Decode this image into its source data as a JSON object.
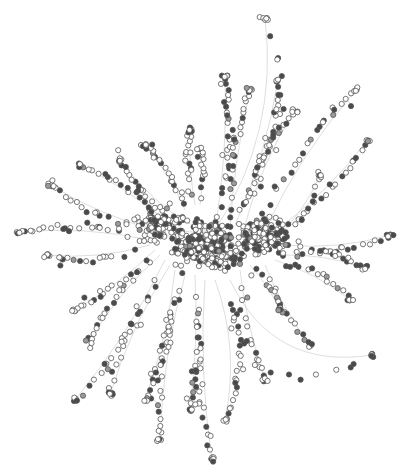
{
  "diagram": {
    "type": "network-graph",
    "layout": "force-directed",
    "width": 410,
    "height": 475,
    "colors": {
      "background": "#ffffff",
      "edge": "#c8c8c8",
      "node_stroke": "#555555",
      "node_fill_light": "#ffffff",
      "node_fill_dark": "#4a4a4a",
      "node_fill_mid": "#9a9a9a"
    },
    "node_radius": 2.6,
    "dark_ratio": 0.33,
    "seed": 17,
    "hubs": [
      {
        "x": 205,
        "y": 245,
        "count": 320,
        "spread": 32
      },
      {
        "x": 262,
        "y": 235,
        "count": 170,
        "spread": 26
      },
      {
        "x": 160,
        "y": 225,
        "count": 90,
        "spread": 24
      }
    ],
    "branches": [
      {
        "from": [
          215,
          230
        ],
        "to": [
          265,
          18
        ],
        "n": 10,
        "bend": 40
      },
      {
        "from": [
          215,
          230
        ],
        "to": [
          225,
          75
        ],
        "n": 22,
        "bend": 8
      },
      {
        "from": [
          230,
          230
        ],
        "to": [
          250,
          90
        ],
        "n": 22,
        "bend": -6
      },
      {
        "from": [
          235,
          225
        ],
        "to": [
          278,
          80
        ],
        "n": 18,
        "bend": 10
      },
      {
        "from": [
          245,
          225
        ],
        "to": [
          295,
          110
        ],
        "n": 20,
        "bend": -10
      },
      {
        "from": [
          265,
          230
        ],
        "to": [
          356,
          90
        ],
        "n": 18,
        "bend": -12
      },
      {
        "from": [
          270,
          235
        ],
        "to": [
          368,
          140
        ],
        "n": 16,
        "bend": 10
      },
      {
        "from": [
          275,
          240
        ],
        "to": [
          320,
          175
        ],
        "n": 10,
        "bend": 8
      },
      {
        "from": [
          285,
          245
        ],
        "to": [
          390,
          235
        ],
        "n": 14,
        "bend": 10
      },
      {
        "from": [
          280,
          255
        ],
        "to": [
          365,
          268
        ],
        "n": 14,
        "bend": -8
      },
      {
        "from": [
          275,
          260
        ],
        "to": [
          350,
          300
        ],
        "n": 12,
        "bend": -8
      },
      {
        "from": [
          265,
          265
        ],
        "to": [
          310,
          345
        ],
        "n": 12,
        "bend": 6
      },
      {
        "from": [
          250,
          265
        ],
        "to": [
          280,
          310
        ],
        "n": 10,
        "bend": -4
      },
      {
        "from": [
          240,
          270
        ],
        "to": [
          265,
          380
        ],
        "n": 12,
        "bend": 6
      },
      {
        "from": [
          230,
          280
        ],
        "to": [
          372,
          355
        ],
        "n": 10,
        "bend": 60
      },
      {
        "from": [
          215,
          280
        ],
        "to": [
          225,
          420
        ],
        "n": 16,
        "bend": -20
      },
      {
        "from": [
          205,
          280
        ],
        "to": [
          212,
          460
        ],
        "n": 16,
        "bend": 10
      },
      {
        "from": [
          195,
          275
        ],
        "to": [
          190,
          410
        ],
        "n": 16,
        "bend": -6
      },
      {
        "from": [
          185,
          275
        ],
        "to": [
          160,
          440
        ],
        "n": 18,
        "bend": 10
      },
      {
        "from": [
          175,
          270
        ],
        "to": [
          145,
          400
        ],
        "n": 18,
        "bend": -8
      },
      {
        "from": [
          170,
          265
        ],
        "to": [
          110,
          395
        ],
        "n": 14,
        "bend": 10
      },
      {
        "from": [
          165,
          260
        ],
        "to": [
          75,
          400
        ],
        "n": 14,
        "bend": -10
      },
      {
        "from": [
          160,
          255
        ],
        "to": [
          90,
          340
        ],
        "n": 14,
        "bend": 8
      },
      {
        "from": [
          155,
          250
        ],
        "to": [
          75,
          310
        ],
        "n": 14,
        "bend": -6
      },
      {
        "from": [
          150,
          245
        ],
        "to": [
          45,
          255
        ],
        "n": 14,
        "bend": -10
      },
      {
        "from": [
          150,
          240
        ],
        "to": [
          20,
          232
        ],
        "n": 16,
        "bend": 10
      },
      {
        "from": [
          155,
          230
        ],
        "to": [
          50,
          185
        ],
        "n": 14,
        "bend": -8
      },
      {
        "from": [
          165,
          220
        ],
        "to": [
          80,
          165
        ],
        "n": 16,
        "bend": 6
      },
      {
        "from": [
          175,
          215
        ],
        "to": [
          120,
          160
        ],
        "n": 14,
        "bend": -6
      },
      {
        "from": [
          185,
          210
        ],
        "to": [
          145,
          145
        ],
        "n": 14,
        "bend": 6
      },
      {
        "from": [
          195,
          205
        ],
        "to": [
          190,
          130
        ],
        "n": 14,
        "bend": -4
      },
      {
        "from": [
          200,
          205
        ],
        "to": [
          200,
          150
        ],
        "n": 10,
        "bend": 4
      }
    ]
  }
}
